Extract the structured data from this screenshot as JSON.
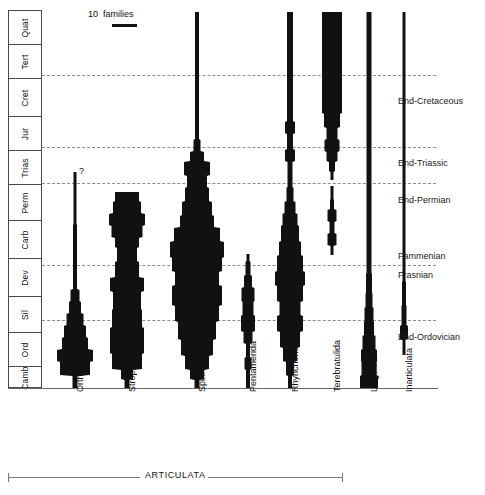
{
  "figure": {
    "kind": "stratigraphic-range-spindle-diagram",
    "scale_legend": {
      "value": "10",
      "unit": "families"
    },
    "clade_bracket": {
      "label": "ARTICULATA"
    },
    "uncertainty_marker": "?"
  },
  "timescale": {
    "axis_label": "",
    "periods": [
      {
        "label": "Quat",
        "top": 0,
        "height": 34
      },
      {
        "label": "Tert",
        "top": 34,
        "height": 34
      },
      {
        "label": "Cret",
        "top": 68,
        "height": 38
      },
      {
        "label": "Jur",
        "top": 106,
        "height": 34
      },
      {
        "label": "Trias",
        "top": 140,
        "height": 34
      },
      {
        "label": "Perm",
        "top": 174,
        "height": 36
      },
      {
        "label": "Carb",
        "top": 210,
        "height": 38
      },
      {
        "label": "Dev",
        "top": 248,
        "height": 38
      },
      {
        "label": "Sil",
        "top": 286,
        "height": 36
      },
      {
        "label": "Ord",
        "top": 322,
        "height": 34
      },
      {
        "label": "Camb",
        "top": 356,
        "height": 22
      }
    ]
  },
  "extinction_events": [
    {
      "label": "End-Cretaceous",
      "y": 65,
      "label_y": 86
    },
    {
      "label": "End-Triassic",
      "y": 137,
      "label_y": 148
    },
    {
      "label": "End-Permian",
      "y": 173,
      "label_y": 185
    },
    {
      "label": "Fammenian",
      "y": 255,
      "label_y": 241
    },
    {
      "label": "Frasnian",
      "y": 255,
      "label_y": 260
    },
    {
      "label": "End-Ordovician",
      "y": 310,
      "label_y": 322
    }
  ],
  "chart_data": {
    "type": "area",
    "xlabel": "",
    "ylabel": "Geologic time",
    "units": "families",
    "time_axis_top": "Quaternary",
    "time_axis_bottom": "Cambrian",
    "taxa": [
      {
        "name": "Orthida",
        "center_x": 33,
        "group": "ARTICULATA",
        "first_appearance": "Cambrian",
        "last_appearance": "end-Permian (queried)",
        "peak_interval": "Ordovician",
        "peak_families": 26,
        "queried_top": true,
        "profile": [
          {
            "y": 378,
            "w": 5
          },
          {
            "y": 366,
            "w": 5
          },
          {
            "y": 365,
            "w": 30
          },
          {
            "y": 352,
            "w": 30
          },
          {
            "y": 351,
            "w": 36
          },
          {
            "y": 340,
            "w": 36
          },
          {
            "y": 339,
            "w": 26
          },
          {
            "y": 328,
            "w": 26
          },
          {
            "y": 327,
            "w": 22
          },
          {
            "y": 316,
            "w": 22
          },
          {
            "y": 315,
            "w": 17
          },
          {
            "y": 304,
            "w": 17
          },
          {
            "y": 303,
            "w": 12
          },
          {
            "y": 292,
            "w": 12
          },
          {
            "y": 291,
            "w": 9
          },
          {
            "y": 280,
            "w": 9
          },
          {
            "y": 279,
            "w": 4
          },
          {
            "y": 215,
            "w": 4
          },
          {
            "y": 214,
            "w": 3
          },
          {
            "y": 162,
            "w": 3
          }
        ]
      },
      {
        "name": "Strophomenida",
        "center_x": 85,
        "group": "ARTICULATA",
        "first_appearance": "Ordovician",
        "last_appearance": "Permian",
        "peak_interval": "Ordovician-Silurian",
        "peak_families": 34,
        "queried_top": false,
        "profile": [
          {
            "y": 378,
            "w": 5
          },
          {
            "y": 370,
            "w": 5
          },
          {
            "y": 369,
            "w": 12
          },
          {
            "y": 360,
            "w": 12
          },
          {
            "y": 359,
            "w": 30
          },
          {
            "y": 344,
            "w": 30
          },
          {
            "y": 343,
            "w": 34
          },
          {
            "y": 318,
            "w": 34
          },
          {
            "y": 317,
            "w": 30
          },
          {
            "y": 300,
            "w": 30
          },
          {
            "y": 299,
            "w": 28
          },
          {
            "y": 282,
            "w": 28
          },
          {
            "y": 281,
            "w": 34
          },
          {
            "y": 268,
            "w": 34
          },
          {
            "y": 267,
            "w": 24
          },
          {
            "y": 252,
            "w": 24
          },
          {
            "y": 251,
            "w": 20
          },
          {
            "y": 238,
            "w": 20
          },
          {
            "y": 237,
            "w": 24
          },
          {
            "y": 228,
            "w": 24
          },
          {
            "y": 227,
            "w": 31
          },
          {
            "y": 216,
            "w": 31
          },
          {
            "y": 215,
            "w": 36
          },
          {
            "y": 204,
            "w": 36
          },
          {
            "y": 203,
            "w": 28
          },
          {
            "y": 192,
            "w": 28
          },
          {
            "y": 191,
            "w": 24
          },
          {
            "y": 182,
            "w": 24
          }
        ]
      },
      {
        "name": "Spiriferida",
        "center_x": 155,
        "group": "ARTICULATA",
        "first_appearance": "Ordovician",
        "last_appearance": "Jurassic",
        "peak_interval": "Carboniferous",
        "peak_families": 54,
        "queried_top": false,
        "profile": [
          {
            "y": 378,
            "w": 5
          },
          {
            "y": 370,
            "w": 5
          },
          {
            "y": 369,
            "w": 14
          },
          {
            "y": 360,
            "w": 14
          },
          {
            "y": 359,
            "w": 24
          },
          {
            "y": 346,
            "w": 24
          },
          {
            "y": 345,
            "w": 32
          },
          {
            "y": 330,
            "w": 32
          },
          {
            "y": 329,
            "w": 38
          },
          {
            "y": 312,
            "w": 38
          },
          {
            "y": 311,
            "w": 44
          },
          {
            "y": 296,
            "w": 44
          },
          {
            "y": 295,
            "w": 50
          },
          {
            "y": 276,
            "w": 50
          },
          {
            "y": 275,
            "w": 44
          },
          {
            "y": 262,
            "w": 44
          },
          {
            "y": 261,
            "w": 50
          },
          {
            "y": 248,
            "w": 50
          },
          {
            "y": 247,
            "w": 54
          },
          {
            "y": 232,
            "w": 54
          },
          {
            "y": 231,
            "w": 46
          },
          {
            "y": 218,
            "w": 46
          },
          {
            "y": 217,
            "w": 34
          },
          {
            "y": 206,
            "w": 34
          },
          {
            "y": 205,
            "w": 30
          },
          {
            "y": 192,
            "w": 30
          },
          {
            "y": 191,
            "w": 24
          },
          {
            "y": 178,
            "w": 24
          },
          {
            "y": 177,
            "w": 20
          },
          {
            "y": 166,
            "w": 20
          },
          {
            "y": 165,
            "w": 26
          },
          {
            "y": 152,
            "w": 26
          },
          {
            "y": 151,
            "w": 14
          },
          {
            "y": 142,
            "w": 14
          },
          {
            "y": 141,
            "w": 7
          },
          {
            "y": 130,
            "w": 7
          },
          {
            "y": 129,
            "w": 4
          },
          {
            "y": 2,
            "w": 4
          }
        ]
      },
      {
        "name": "Pentamerida",
        "center_x": 206,
        "group": "ARTICULATA",
        "first_appearance": "Cambrian",
        "last_appearance": "Devonian",
        "peak_interval": "Silurian",
        "peak_families": 15,
        "queried_top": false,
        "profile": [
          {
            "y": 378,
            "w": 4
          },
          {
            "y": 360,
            "w": 4
          },
          {
            "y": 359,
            "w": 7
          },
          {
            "y": 348,
            "w": 7
          },
          {
            "y": 347,
            "w": 4
          },
          {
            "y": 334,
            "w": 4
          },
          {
            "y": 333,
            "w": 9
          },
          {
            "y": 322,
            "w": 9
          },
          {
            "y": 321,
            "w": 14
          },
          {
            "y": 306,
            "w": 14
          },
          {
            "y": 305,
            "w": 11
          },
          {
            "y": 292,
            "w": 11
          },
          {
            "y": 291,
            "w": 13
          },
          {
            "y": 278,
            "w": 13
          },
          {
            "y": 277,
            "w": 8
          },
          {
            "y": 266,
            "w": 8
          },
          {
            "y": 265,
            "w": 5
          },
          {
            "y": 252,
            "w": 5
          },
          {
            "y": 251,
            "w": 3
          },
          {
            "y": 244,
            "w": 3
          }
        ]
      },
      {
        "name": "Rhynchonellida",
        "center_x": 248,
        "group": "ARTICULATA",
        "first_appearance": "Ordovician",
        "last_appearance": "Recent",
        "peak_interval": "Devonian",
        "peak_families": 30,
        "queried_top": false,
        "profile": [
          {
            "y": 378,
            "w": 4
          },
          {
            "y": 366,
            "w": 4
          },
          {
            "y": 365,
            "w": 8
          },
          {
            "y": 352,
            "w": 8
          },
          {
            "y": 351,
            "w": 14
          },
          {
            "y": 338,
            "w": 14
          },
          {
            "y": 337,
            "w": 20
          },
          {
            "y": 322,
            "w": 20
          },
          {
            "y": 321,
            "w": 26
          },
          {
            "y": 306,
            "w": 26
          },
          {
            "y": 305,
            "w": 21
          },
          {
            "y": 292,
            "w": 21
          },
          {
            "y": 291,
            "w": 26
          },
          {
            "y": 276,
            "w": 26
          },
          {
            "y": 275,
            "w": 30
          },
          {
            "y": 262,
            "w": 30
          },
          {
            "y": 261,
            "w": 26
          },
          {
            "y": 246,
            "w": 26
          },
          {
            "y": 245,
            "w": 22
          },
          {
            "y": 232,
            "w": 22
          },
          {
            "y": 231,
            "w": 18
          },
          {
            "y": 216,
            "w": 18
          },
          {
            "y": 215,
            "w": 15
          },
          {
            "y": 204,
            "w": 15
          },
          {
            "y": 203,
            "w": 11
          },
          {
            "y": 192,
            "w": 11
          },
          {
            "y": 191,
            "w": 7
          },
          {
            "y": 178,
            "w": 7
          },
          {
            "y": 177,
            "w": 5
          },
          {
            "y": 152,
            "w": 5
          },
          {
            "y": 151,
            "w": 10
          },
          {
            "y": 140,
            "w": 10
          },
          {
            "y": 139,
            "w": 6
          },
          {
            "y": 124,
            "w": 6
          },
          {
            "y": 123,
            "w": 10
          },
          {
            "y": 112,
            "w": 10
          },
          {
            "y": 111,
            "w": 6
          },
          {
            "y": 2,
            "w": 6
          }
        ]
      },
      {
        "name": "Terebratulida",
        "center_x": 290,
        "group": "ARTICULATA",
        "first_appearance": "Devonian",
        "last_appearance": "Recent",
        "peak_interval": "Cretaceous-Tertiary",
        "peak_families": 20,
        "gap_interval": "end-Permian",
        "queried_top": false,
        "profile": [
          {
            "y": 245,
            "w": 3
          },
          {
            "y": 236,
            "w": 3
          },
          {
            "y": 235,
            "w": 9
          },
          {
            "y": 224,
            "w": 9
          },
          {
            "y": 223,
            "w": 5
          },
          {
            "y": 212,
            "w": 5
          },
          {
            "y": 211,
            "w": 9
          },
          {
            "y": 200,
            "w": 9
          },
          {
            "y": 199,
            "w": 4
          },
          {
            "y": 190,
            "w": 4
          },
          {
            "y": 189,
            "w": 3
          },
          {
            "y": 176,
            "w": 3
          }
        ],
        "profile_upper": [
          {
            "y": 170,
            "w": 3
          },
          {
            "y": 162,
            "w": 3
          },
          {
            "y": 161,
            "w": 6
          },
          {
            "y": 152,
            "w": 6
          },
          {
            "y": 151,
            "w": 11
          },
          {
            "y": 142,
            "w": 11
          },
          {
            "y": 141,
            "w": 15
          },
          {
            "y": 130,
            "w": 15
          },
          {
            "y": 129,
            "w": 11
          },
          {
            "y": 118,
            "w": 11
          },
          {
            "y": 117,
            "w": 16
          },
          {
            "y": 104,
            "w": 16
          },
          {
            "y": 103,
            "w": 20
          },
          {
            "y": 2,
            "w": 20
          }
        ]
      },
      {
        "name": "Lingulata",
        "center_x": 327,
        "group": "INARTICULATA",
        "first_appearance": "Cambrian",
        "last_appearance": "Recent",
        "peak_interval": "Cambrian",
        "peak_families": 18,
        "queried_top": false,
        "profile": [
          {
            "y": 378,
            "w": 18
          },
          {
            "y": 366,
            "w": 18
          },
          {
            "y": 365,
            "w": 15
          },
          {
            "y": 352,
            "w": 15
          },
          {
            "y": 351,
            "w": 16
          },
          {
            "y": 340,
            "w": 16
          },
          {
            "y": 339,
            "w": 13
          },
          {
            "y": 326,
            "w": 13
          },
          {
            "y": 325,
            "w": 10
          },
          {
            "y": 312,
            "w": 10
          },
          {
            "y": 311,
            "w": 9
          },
          {
            "y": 298,
            "w": 9
          },
          {
            "y": 297,
            "w": 7
          },
          {
            "y": 284,
            "w": 7
          },
          {
            "y": 283,
            "w": 6
          },
          {
            "y": 264,
            "w": 6
          },
          {
            "y": 263,
            "w": 5
          },
          {
            "y": 2,
            "w": 5
          }
        ]
      },
      {
        "name": "Inarticulata",
        "center_x": 362,
        "group": "INARTICULATA",
        "first_appearance": "Ordovician",
        "last_appearance": "Recent",
        "peak_interval": "Ordovician",
        "peak_families": 8,
        "queried_top": false,
        "profile": [
          {
            "y": 345,
            "w": 3
          },
          {
            "y": 330,
            "w": 3
          },
          {
            "y": 329,
            "w": 8
          },
          {
            "y": 316,
            "w": 8
          },
          {
            "y": 315,
            "w": 5
          },
          {
            "y": 296,
            "w": 5
          },
          {
            "y": 295,
            "w": 4
          },
          {
            "y": 272,
            "w": 4
          },
          {
            "y": 271,
            "w": 3
          },
          {
            "y": 2,
            "w": 3
          }
        ]
      }
    ]
  },
  "taxon_labels": [
    {
      "name": "Orthida",
      "x": 75
    },
    {
      "name": "Strophomenida",
      "x": 127
    },
    {
      "name": "Spiriferida",
      "x": 197
    },
    {
      "name": "Pentamerida",
      "x": 248
    },
    {
      "name": "Rhynchonellida",
      "x": 290
    },
    {
      "name": "Terebratulida",
      "x": 332
    },
    {
      "name": "Lingulata",
      "x": 369
    },
    {
      "name": "Inarticulata",
      "x": 404
    }
  ]
}
